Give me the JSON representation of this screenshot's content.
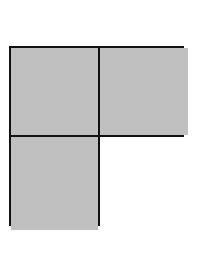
{
  "diagram": {
    "type": "fraction-grid",
    "rows": 2,
    "cols": 2,
    "cells": [
      {
        "row": 0,
        "col": 0,
        "shaded": true,
        "color": "#c0c0c0"
      },
      {
        "row": 0,
        "col": 1,
        "shaded": true,
        "color": "#c0c0c0"
      },
      {
        "row": 1,
        "col": 0,
        "shaded": true,
        "color": "#c0c0c0"
      },
      {
        "row": 1,
        "col": 1,
        "shaded": false,
        "color": "#ffffff"
      }
    ],
    "border_color": "#111111"
  }
}
